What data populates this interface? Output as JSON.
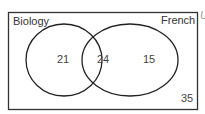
{
  "diagram": {
    "type": "venn",
    "universal_symbol": "U",
    "sets": [
      {
        "name": "Biology",
        "only": "21"
      },
      {
        "name": "French",
        "only": "15"
      }
    ],
    "intersection": "24",
    "outside": "35"
  }
}
